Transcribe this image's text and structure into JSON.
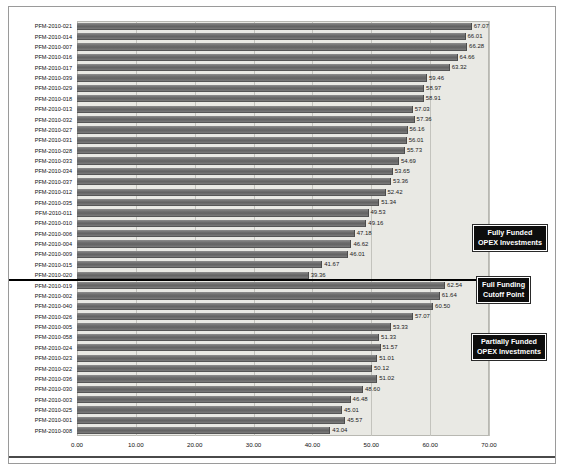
{
  "chart_data": {
    "type": "bar",
    "orientation": "horizontal",
    "title": "",
    "xlabel": "",
    "ylabel": "",
    "xlim": [
      0,
      70
    ],
    "xticks": [
      "0.00",
      "10.00",
      "20.00",
      "30.00",
      "40.00",
      "50.00",
      "60.00",
      "70.00"
    ],
    "xtick_values": [
      0,
      10,
      20,
      30,
      40,
      50,
      60,
      70
    ],
    "grid": true,
    "legend": false,
    "categories": [
      "PFM-2010-021",
      "PFM-2010-014",
      "PFM-2010-007",
      "PFM-2010-016",
      "PFM-2010-017",
      "PFM-2010-039",
      "PFM-2010-029",
      "PFM-2010-018",
      "PFM-2010-013",
      "PFM-2010-032",
      "PFM-2010-027",
      "PFM-2010-031",
      "PFM-2010-028",
      "PFM-2010-033",
      "PFM-2010-034",
      "PFM-2010-037",
      "PFM-2010-012",
      "PFM-2010-035",
      "PFM-2010-011",
      "PFM-2010-010",
      "PFM-2010-006",
      "PFM-2010-004",
      "PFM-2010-009",
      "PFM-2010-015",
      "PFM-2010-020",
      "PFM-2010-019",
      "PFM-2010-002",
      "PFM-2010-040",
      "PFM-2010-026",
      "PFM-2010-005",
      "PFM-2010-058",
      "PFM-2010-024",
      "PFM-2010-023",
      "PFM-2010-022",
      "PFM-2010-036",
      "PFM-2010-030",
      "PFM-2010-003",
      "PFM-2010-025",
      "PFM-2010-001",
      "PFM-2010-008"
    ],
    "values": [
      67.07,
      66.01,
      66.28,
      64.66,
      63.32,
      59.46,
      58.97,
      58.91,
      57.03,
      57.36,
      56.16,
      56.01,
      55.73,
      54.69,
      53.65,
      53.36,
      52.42,
      51.34,
      49.53,
      49.16,
      47.18,
      46.62,
      46.01,
      41.67,
      39.36,
      62.54,
      61.64,
      60.5,
      57.07,
      53.33,
      51.33,
      51.57,
      51.01,
      50.12,
      51.02,
      48.6,
      46.48,
      45.01,
      45.57,
      43.04
    ],
    "value_labels": [
      "67.07",
      "66.01",
      "66.28",
      "64.66",
      "63.32",
      "59.46",
      "58.97",
      "58.91",
      "57.03",
      "57.36",
      "56.16",
      "56.01",
      "55.73",
      "54.69",
      "53.65",
      "53.36",
      "52.42",
      "51.34",
      "49.53",
      "49.16",
      "47.18",
      "46.62",
      "46.01",
      "41.67",
      "39.36",
      "62.54",
      "61.64",
      "60.50",
      "57.07",
      "53.33",
      "51.33",
      "51.57",
      "51.01",
      "50.12",
      "51.02",
      "48.60",
      "46.48",
      "45.01",
      "45.57",
      "43.04"
    ],
    "cutoff_after_index": 24,
    "annotations": [
      {
        "id": "fully-funded",
        "lines": [
          "Fully Funded",
          "OPEX Investments"
        ]
      },
      {
        "id": "cutoff",
        "lines": [
          "Full Funding",
          "Cutoff Point"
        ]
      },
      {
        "id": "partially-funded",
        "lines": [
          "Partially Funded",
          "OPEX Investments"
        ]
      }
    ]
  },
  "colors": {
    "bar": "#6f6f6f",
    "plot_background": "#e9e9e4",
    "gridline": "#c3c3bd",
    "cutoff_line": "#000000",
    "callout_background": "#0d0d0d",
    "callout_text": "#ffffff"
  }
}
